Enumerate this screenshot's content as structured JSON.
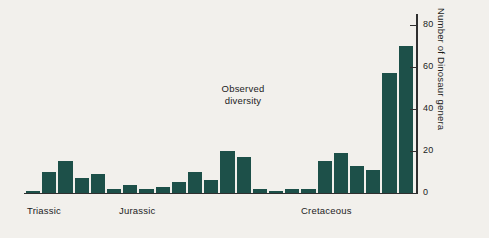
{
  "chart_data": {
    "type": "bar",
    "title": "",
    "subtitle": "",
    "xlabel": "",
    "ylabel": "Number of Dinosaur genera",
    "ylim": [
      0,
      85
    ],
    "yticks": [
      0,
      20,
      40,
      60,
      80
    ],
    "ytick_labels": [
      "0",
      "20",
      "40",
      "60",
      "80"
    ],
    "grid": false,
    "legend": null,
    "bar_color": "#1d5049",
    "background_color": "#f2f0ec",
    "categories": [
      "T1",
      "T2",
      "T3",
      "T4",
      "T5",
      "J1",
      "J2",
      "J3",
      "J4",
      "J5",
      "J6",
      "J7",
      "J8",
      "J9",
      "J10",
      "J11",
      "K1",
      "K2",
      "K3",
      "K4",
      "K5",
      "K6",
      "K7",
      "K8"
    ],
    "values": [
      1,
      10,
      15,
      7,
      9,
      2,
      4,
      2,
      3,
      5,
      10,
      6,
      20,
      17,
      2,
      1,
      2,
      2,
      15,
      19,
      13,
      11,
      57,
      70
    ],
    "annotations": [
      {
        "text_line1": "Observed",
        "text_line2": "diversity"
      }
    ],
    "period_labels": [
      {
        "label": "Triassic"
      },
      {
        "label": "Jurassic"
      },
      {
        "label": "Cretaceous"
      }
    ]
  }
}
